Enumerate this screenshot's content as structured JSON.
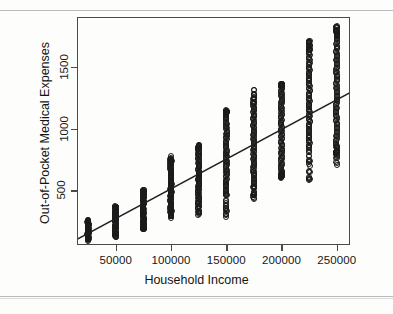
{
  "chart_data": {
    "type": "scatter",
    "title": "",
    "xlabel": "Household Income",
    "ylabel": "Out-of-Pocket Medical Expenses",
    "xlim": [
      15000,
      262000
    ],
    "ylim": [
      60,
      1900
    ],
    "grid": false,
    "legend": null,
    "xticks": [
      50000,
      100000,
      150000,
      200000,
      250000
    ],
    "xtick_labels": [
      "50000",
      "100000",
      "150000",
      "200000",
      "250000"
    ],
    "yticks": [
      500,
      1000,
      1500
    ],
    "ytick_labels": [
      "500",
      "1000",
      "1500"
    ],
    "marker": "open-circle",
    "marker_color": "#1a1a1a",
    "series": [
      {
        "name": "Households",
        "note": "Income is binned at 25000 increments; each bin is a dense vertical column of points.",
        "bins": [
          {
            "x": 25000,
            "y_min": 95,
            "y_max": 260,
            "y_dense_min": 120,
            "y_dense_max": 245,
            "n": 60
          },
          {
            "x": 50000,
            "y_min": 120,
            "y_max": 375,
            "y_dense_min": 160,
            "y_dense_max": 360,
            "n": 70
          },
          {
            "x": 75000,
            "y_min": 185,
            "y_max": 520,
            "y_dense_min": 210,
            "y_dense_max": 470,
            "n": 75
          },
          {
            "x": 100000,
            "y_min": 265,
            "y_max": 790,
            "y_dense_min": 330,
            "y_dense_max": 720,
            "n": 85
          },
          {
            "x": 125000,
            "y_min": 290,
            "y_max": 870,
            "y_dense_min": 395,
            "y_dense_max": 840,
            "n": 85
          },
          {
            "x": 150000,
            "y_min": 280,
            "y_max": 1165,
            "y_dense_min": 470,
            "y_dense_max": 1110,
            "n": 95
          },
          {
            "x": 175000,
            "y_min": 415,
            "y_max": 1345,
            "y_dense_min": 530,
            "y_dense_max": 1185,
            "n": 95
          },
          {
            "x": 200000,
            "y_min": 600,
            "y_max": 1360,
            "y_dense_min": 640,
            "y_dense_max": 1345,
            "n": 100
          },
          {
            "x": 225000,
            "y_min": 565,
            "y_max": 1715,
            "y_dense_min": 840,
            "y_dense_max": 1630,
            "n": 105
          },
          {
            "x": 250000,
            "y_min": 700,
            "y_max": 1830,
            "y_dense_min": 855,
            "y_dense_max": 1745,
            "n": 110
          }
        ]
      }
    ],
    "fit_line": {
      "type": "linear-regression",
      "x_start": 15000,
      "y_start": 105,
      "x_end": 262000,
      "y_end": 1290,
      "color": "#1f1f1f"
    }
  },
  "axes": {
    "x": {
      "label": "Household Income",
      "ticks": [
        {
          "label": "50000",
          "value": 50000
        },
        {
          "label": "100000",
          "value": 100000
        },
        {
          "label": "150000",
          "value": 150000
        },
        {
          "label": "200000",
          "value": 200000
        },
        {
          "label": "250000",
          "value": 250000
        }
      ]
    },
    "y": {
      "label": "Out-of-Pocket Medical Expenses",
      "ticks": [
        {
          "label": "500",
          "value": 500
        },
        {
          "label": "1000",
          "value": 1000
        },
        {
          "label": "1500",
          "value": 1500
        }
      ]
    }
  }
}
